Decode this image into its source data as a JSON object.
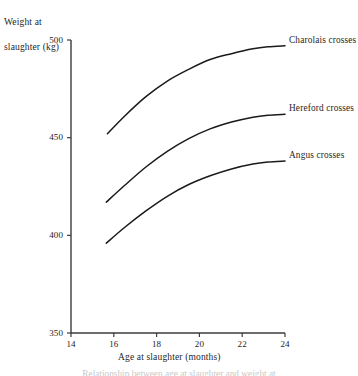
{
  "chart_data": {
    "type": "line",
    "title": "",
    "xlabel": "Age at slaughter (months)",
    "ylabel": "Weight at\nslaughter (kg)",
    "ylabel_lines": [
      "Weight at",
      "slaughter (kg)"
    ],
    "xlim": [
      14,
      24
    ],
    "ylim": [
      350,
      500
    ],
    "xticks": [
      14,
      16,
      18,
      20,
      22,
      24
    ],
    "yticks": [
      350,
      400,
      450,
      500
    ],
    "xtick_labels": [
      "14",
      "16",
      "18",
      "20",
      "22",
      "24"
    ],
    "ytick_labels": [
      "350",
      "400",
      "450",
      "500"
    ],
    "grid": false,
    "legend_position": "inline-right-of-curve-ends",
    "line_color": "#1a1a1a",
    "axis_color": "#3c3c3c",
    "series": [
      {
        "name": "Charolais crosses",
        "label": "Charolais crosses",
        "x": [
          15.7,
          16.5,
          17.5,
          18.5,
          19.5,
          20.5,
          21.5,
          22.5,
          23.2,
          24.0
        ],
        "values": [
          452,
          461,
          471,
          479,
          485,
          490,
          493,
          495.5,
          496.5,
          497
        ]
      },
      {
        "name": "Hereford crosses",
        "label": "Hereford crosses",
        "x": [
          15.65,
          16.5,
          17.5,
          18.5,
          19.5,
          20.5,
          21.5,
          22.5,
          23.2,
          24.0
        ],
        "values": [
          417,
          425.5,
          435,
          443,
          449.5,
          454.5,
          458,
          460.5,
          461.5,
          462
        ]
      },
      {
        "name": "Angus crosses",
        "label": "Angus crosses",
        "x": [
          15.65,
          16.5,
          17.5,
          18.5,
          19.5,
          20.5,
          21.5,
          22.5,
          23.2,
          24.0
        ],
        "values": [
          396,
          404,
          412.5,
          420,
          426,
          430.5,
          434,
          436.5,
          437.5,
          438
        ]
      }
    ]
  },
  "geometry": {
    "plot_left": 71,
    "plot_right": 285,
    "plot_top": 40,
    "plot_bottom": 333
  },
  "caption": {
    "text": "Relationship between age at slaughter and weight at"
  }
}
